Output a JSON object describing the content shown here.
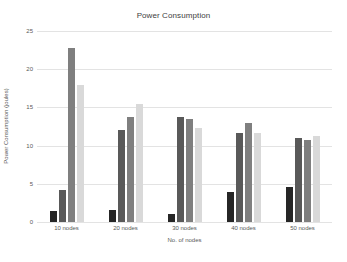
{
  "figure": {
    "background": "#ffffff",
    "text_color": "#595959",
    "title_color": "#404040",
    "gridline_color": "#e3e3e3"
  },
  "chart_data": {
    "type": "bar",
    "title": "Power Consumption",
    "xlabel": "No. of nodes",
    "ylabel": "Power Consumption (joules)",
    "categories": [
      "10 nodes",
      "20 nodes",
      "30 nodes",
      "40 nodes",
      "50 nodes"
    ],
    "series": [
      {
        "name": "0%",
        "color": "#262626",
        "values": [
          1.4,
          1.6,
          1.1,
          3.9,
          4.6
        ]
      },
      {
        "name": "10%",
        "color": "#595959",
        "values": [
          4.2,
          12.0,
          13.7,
          11.7,
          11.0
        ]
      },
      {
        "name": "20%",
        "color": "#7f7f7f",
        "values": [
          22.8,
          13.7,
          13.5,
          13.0,
          10.8
        ]
      },
      {
        "name": "30%",
        "color": "#d9d9d9",
        "values": [
          17.9,
          15.4,
          12.3,
          11.7,
          11.2
        ]
      }
    ],
    "ylim": [
      0,
      25
    ],
    "yticks": [
      0,
      5,
      10,
      15,
      20,
      25
    ],
    "grid": true,
    "legend_position": "top-right"
  }
}
